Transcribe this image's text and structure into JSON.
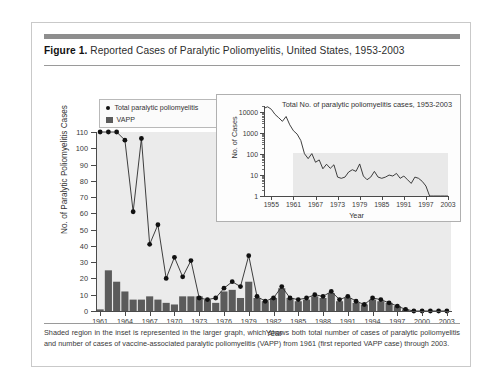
{
  "figure": {
    "title_lead": "Figure 1.",
    "title_rest": " Reported Cases of Paralytic Poliomyelitis, United States, 1953-2003",
    "footnote": "Shaded region in the inset is represented in the larger graph, which shows both total number of cases of paralytic poliomyelitis and number of cases of vaccine-associated paralytic poliomyelitis (VAPP) from 1961 (first reported VAPP case) through 2003."
  },
  "colors": {
    "bar": "#5b5b5b",
    "dot": "#111111",
    "plot_background": "#ebebeb",
    "inset_shade": "#e9e9e9",
    "axis": "#4a4a4a",
    "rule": "#8e8e8e",
    "card_border": "#c9c9c9"
  },
  "legend": {
    "items": [
      {
        "label": "Total paralytic poliomyelitis",
        "marker": "dot"
      },
      {
        "label": "VAPP",
        "marker": "square"
      }
    ]
  },
  "chart_data": [
    {
      "id": "main",
      "type": "bar",
      "title": "",
      "xlabel": "Year",
      "ylabel": "No. of Paralytic Poliomyelitis Cases",
      "xlim": [
        1961,
        2003
      ],
      "ylim": [
        0,
        110
      ],
      "ytick_values": [
        0,
        10,
        20,
        30,
        40,
        50,
        60,
        70,
        80,
        90,
        100,
        110
      ],
      "xtick_values": [
        1961,
        1964,
        1967,
        1970,
        1973,
        1976,
        1979,
        1982,
        1985,
        1988,
        1991,
        1994,
        1997,
        2000,
        2003
      ],
      "grid": false,
      "legend_position": "top-left",
      "x": [
        1961,
        1962,
        1963,
        1964,
        1965,
        1966,
        1967,
        1968,
        1969,
        1970,
        1971,
        1972,
        1973,
        1974,
        1975,
        1976,
        1977,
        1978,
        1979,
        1980,
        1981,
        1982,
        1983,
        1984,
        1985,
        1986,
        1987,
        1988,
        1989,
        1990,
        1991,
        1992,
        1993,
        1994,
        1995,
        1996,
        1997,
        1998,
        1999,
        2000,
        2001,
        2002,
        2003
      ],
      "series": [
        {
          "name": "Total paralytic poliomyelitis",
          "marker": "dot",
          "values": [
            1312,
            910,
            449,
            105,
            61,
            106,
            41,
            53,
            20,
            33,
            21,
            31,
            8,
            7,
            8,
            14,
            18,
            15,
            34,
            9,
            6,
            8,
            15,
            8,
            7,
            8,
            10,
            9,
            12,
            7,
            9,
            6,
            4,
            8,
            7,
            5,
            3,
            1,
            0,
            0,
            0,
            0,
            0
          ]
        },
        {
          "name": "VAPP",
          "marker": "bar",
          "values": [
            1,
            25,
            18,
            12,
            7,
            7,
            9,
            7,
            5,
            4,
            9,
            9,
            9,
            7,
            5,
            12,
            13,
            8,
            18,
            8,
            6,
            8,
            14,
            8,
            6,
            7,
            9,
            8,
            11,
            6,
            8,
            5,
            4,
            7,
            6,
            5,
            3,
            1,
            0,
            0,
            0,
            0,
            0
          ]
        }
      ]
    },
    {
      "id": "inset",
      "type": "line",
      "title": "Total No. of paralytic poliomyelitis cases, 1953-2003",
      "xlabel": "Year",
      "ylabel": "No. of Cases",
      "yscale": "log",
      "xlim": [
        1953,
        2003
      ],
      "ylim": [
        1,
        20000
      ],
      "ytick_values": [
        1,
        10,
        100,
        1000,
        10000
      ],
      "ytick_labels": [
        "1",
        "10",
        "100",
        "1000",
        "10000"
      ],
      "xtick_values": [
        1955,
        1961,
        1967,
        1973,
        1979,
        1985,
        1991,
        1997,
        2003
      ],
      "grid": false,
      "shaded_region": {
        "x_start": 1961,
        "x_end": 2003,
        "y_start": 1,
        "y_end": 110
      },
      "x": [
        1953,
        1954,
        1955,
        1956,
        1957,
        1958,
        1959,
        1960,
        1961,
        1962,
        1963,
        1964,
        1965,
        1966,
        1967,
        1968,
        1969,
        1970,
        1971,
        1972,
        1973,
        1974,
        1975,
        1976,
        1977,
        1978,
        1979,
        1980,
        1981,
        1982,
        1983,
        1984,
        1985,
        1986,
        1987,
        1988,
        1989,
        1990,
        1991,
        1992,
        1993,
        1994,
        1995,
        1996,
        1997,
        1998,
        1999,
        2000,
        2001,
        2002,
        2003
      ],
      "values": [
        15648,
        18308,
        13850,
        7911,
        5485,
        3697,
        6289,
        2525,
        1312,
        910,
        449,
        105,
        61,
        106,
        41,
        53,
        20,
        33,
        21,
        31,
        8,
        7,
        8,
        14,
        18,
        15,
        34,
        9,
        6,
        8,
        15,
        8,
        7,
        8,
        10,
        9,
        12,
        7,
        9,
        6,
        4,
        8,
        7,
        5,
        3,
        1,
        1,
        1,
        1,
        1,
        1
      ],
      "series_name": "Total No. of paralytic poliomyelitis cases"
    }
  ]
}
